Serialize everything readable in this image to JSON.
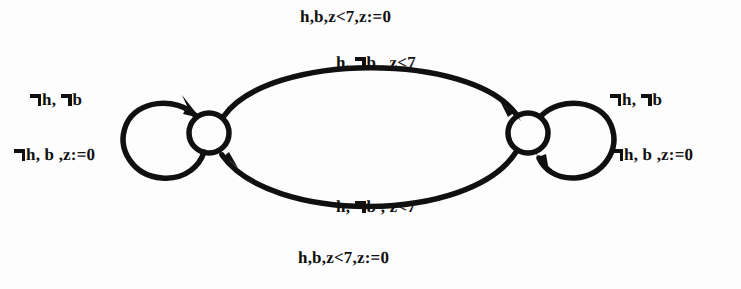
{
  "figure": {
    "type": "state-transition-diagram",
    "background_color": "#fdfdfd",
    "ink_color": "#101010"
  },
  "states": [
    {
      "id": "left-state",
      "label": "",
      "cx": 209,
      "cy": 133,
      "r": 20
    },
    {
      "id": "right-state",
      "label": "",
      "cx": 528,
      "cy": 133,
      "r": 20
    }
  ],
  "transitions": {
    "top_arc": {
      "from": "left-state",
      "to": "right-state",
      "direction": "left-to-right",
      "outer_label": "h,b,z<7,z:=0",
      "inner_label_parts": {
        "pre": "h, ",
        "neg": "¬",
        "post": "b , z<7"
      },
      "inner_label": "h, ¬b , z<7"
    },
    "bottom_arc": {
      "from": "right-state",
      "to": "left-state",
      "direction": "right-to-left",
      "inner_label_parts": {
        "pre": "h, ",
        "neg": "¬",
        "post": "b , z<7"
      },
      "inner_label": "h, ¬b , z<7",
      "outer_label": "h,b,z<7,z:=0"
    },
    "left_self_loop": {
      "on": "left-state",
      "upper_label_parts": {
        "neg1": "¬",
        "mid": "h, ",
        "neg2": "¬",
        "post": "b"
      },
      "upper_label": "¬h, ¬b",
      "lower_label_parts": {
        "neg1": "¬",
        "post": "h, b ,z:=0"
      },
      "lower_label": "¬h, b ,z:=0"
    },
    "right_self_loop": {
      "on": "right-state",
      "upper_label_parts": {
        "neg1": "¬",
        "mid": "h, ",
        "neg2": "¬",
        "post": "b"
      },
      "upper_label": "¬h, ¬b",
      "lower_label_parts": {
        "neg1": "¬",
        "post": "h, b ,z:=0"
      },
      "lower_label": "¬h, b ,z:=0"
    }
  },
  "labels": {
    "top_outer": "h,b,z<7,z:=0",
    "top_inner_pre": "h, ",
    "top_inner_post": "b , z<7",
    "bottom_inner_pre": "h, ",
    "bottom_inner_post": "b , z<7",
    "bottom_outer": "h,b,z<7,z:=0",
    "left_upper_mid": "h, ",
    "left_upper_post": "b",
    "left_lower_post": "h, b ,z:=0",
    "right_upper_mid": "h, ",
    "right_upper_post": "b",
    "right_lower_post": "h, b ,z:=0"
  }
}
